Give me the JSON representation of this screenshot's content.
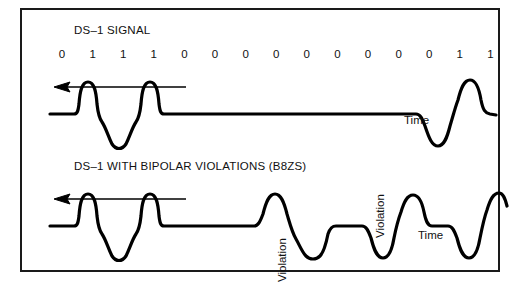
{
  "figure": {
    "border_color": "#1a1a1a",
    "stroke_color": "#000000",
    "background": "#ffffff"
  },
  "panels": [
    {
      "id": "top",
      "title": "DS–1 SIGNAL",
      "axis_label": "Time",
      "arrow_direction": "left"
    },
    {
      "id": "bottom",
      "title": "DS–1 WITH BIPOLAR VIOLATIONS (B8ZS)",
      "axis_label": "Time",
      "arrow_direction": "left",
      "annotations": [
        {
          "text": "Violation",
          "orientation": "vertical"
        },
        {
          "text": "Violation",
          "orientation": "vertical"
        }
      ]
    }
  ],
  "bit_stream": {
    "bits": [
      "0",
      "1",
      "1",
      "1",
      "0",
      "0",
      "0",
      "0",
      "0",
      "0",
      "0",
      "0",
      "0",
      "1",
      "1"
    ],
    "count": 15
  },
  "chart_data": {
    "type": "line",
    "xlabel": "Time",
    "ylabel": "Line voltage",
    "x": [
      "0",
      "1",
      "1",
      "1",
      "0",
      "0",
      "0",
      "0",
      "0",
      "0",
      "0",
      "0",
      "0",
      "1",
      "1"
    ],
    "series": [
      {
        "name": "DS–1 SIGNAL",
        "description": "Alternate mark inversion: marks alternate +/- polarity, zeros held at baseline",
        "values": [
          0,
          1,
          -1,
          1,
          0,
          0,
          0,
          0,
          0,
          0,
          0,
          0,
          0,
          -1,
          1
        ]
      },
      {
        "name": "DS–1 WITH BIPOLAR VIOLATIONS (B8ZS)",
        "description": "Eight-zero string replaced by 000VB0VB substitution containing two deliberate bipolar violations",
        "values": [
          0,
          1,
          -1,
          1,
          0,
          0,
          0,
          1,
          -1,
          0,
          -1,
          1,
          0,
          -1,
          1
        ],
        "violation_indices": [
          7,
          11
        ]
      }
    ],
    "ylim": [
      -1.2,
      1.2
    ],
    "grid": false,
    "legend": "none"
  }
}
